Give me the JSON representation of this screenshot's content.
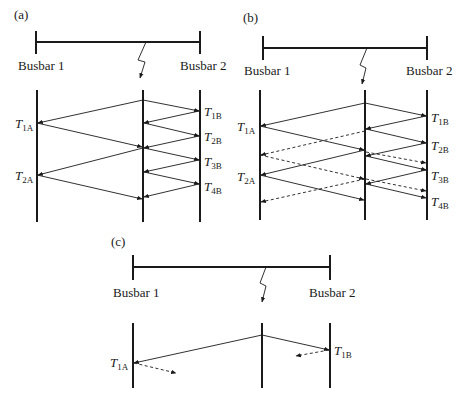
{
  "panels": {
    "a": {
      "label": "(a)",
      "busbar1": "Busbar 1",
      "busbar2": "Busbar 2",
      "terminals_A": [
        {
          "t": "T",
          "sub": "1A"
        },
        {
          "t": "T",
          "sub": "2A"
        }
      ],
      "terminals_B": [
        {
          "t": "T",
          "sub": "1B"
        },
        {
          "t": "T",
          "sub": "2B"
        },
        {
          "t": "T",
          "sub": "3B"
        },
        {
          "t": "T",
          "sub": "4B"
        }
      ]
    },
    "b": {
      "label": "(b)",
      "busbar1": "Busbar 1",
      "busbar2": "Busbar 2",
      "terminals_A": [
        {
          "t": "T",
          "sub": "1A"
        },
        {
          "t": "T",
          "sub": "2A"
        }
      ],
      "terminals_B": [
        {
          "t": "T",
          "sub": "1B"
        },
        {
          "t": "T",
          "sub": "2B"
        },
        {
          "t": "T",
          "sub": "3B"
        },
        {
          "t": "T",
          "sub": "4B"
        }
      ]
    },
    "c": {
      "label": "(c)",
      "busbar1": "Busbar 1",
      "busbar2": "Busbar 2",
      "terminals_A": [
        {
          "t": "T",
          "sub": "1A"
        }
      ],
      "terminals_B": [
        {
          "t": "T",
          "sub": "1B"
        }
      ]
    }
  }
}
